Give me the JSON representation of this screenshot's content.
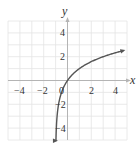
{
  "chart_data": {
    "type": "line",
    "title": "",
    "xlabel": "x",
    "ylabel": "y",
    "xlim": [
      -5,
      5
    ],
    "ylim": [
      -5,
      5
    ],
    "grid": true,
    "grid_step": 1,
    "x_ticks": [
      -4,
      -2,
      0,
      2,
      4
    ],
    "y_ticks": [
      4,
      2,
      -2,
      -4
    ],
    "x_tick_labels": [
      "−4",
      "−2",
      "0",
      "2",
      "4"
    ],
    "y_tick_labels": [
      "4",
      "2",
      "−2",
      "−4"
    ],
    "series": [
      {
        "name": "y = log2(x + 1)",
        "function": "log2(x+1)",
        "vertical_asymptote": -1,
        "x": [
          -0.97,
          -0.9,
          -0.75,
          -0.5,
          0,
          0.5,
          1,
          2,
          3,
          4,
          4.7
        ],
        "y": [
          -5.06,
          -3.32,
          -2.0,
          -1.0,
          0,
          0.58,
          1.0,
          1.58,
          2.0,
          2.32,
          2.51
        ],
        "arrow_start": true,
        "arrow_end": true
      }
    ]
  },
  "colors": {
    "grid": "#e4e4e4",
    "axis": "#b4b4b4",
    "curve": "#555555",
    "text": "#333333"
  },
  "labels": {
    "x_axis": "x",
    "y_axis": "y",
    "tick_x_m4": "−4",
    "tick_x_m2": "−2",
    "tick_origin": "0",
    "tick_x_2": "2",
    "tick_x_4": "4",
    "tick_y_4": "4",
    "tick_y_2": "2",
    "tick_y_m2": "−2",
    "tick_y_m4": "−4"
  }
}
